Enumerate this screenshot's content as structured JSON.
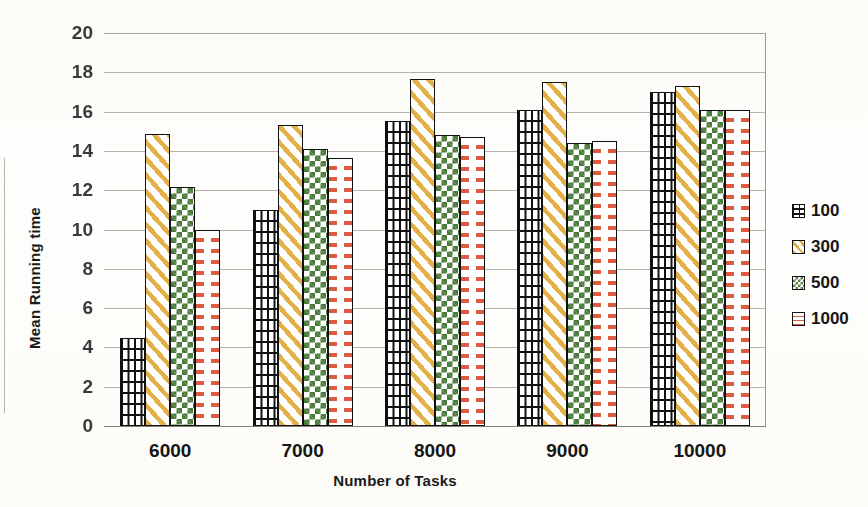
{
  "chart_data": {
    "type": "bar",
    "title": "",
    "xlabel": "Number of Tasks",
    "ylabel": "Mean Running time",
    "categories": [
      "6000",
      "7000",
      "8000",
      "9000",
      "10000"
    ],
    "series": [
      {
        "name": "100",
        "values": [
          4.5,
          11.0,
          15.5,
          16.1,
          17.0
        ],
        "pattern": "brick",
        "color": "#111111"
      },
      {
        "name": "300",
        "values": [
          14.85,
          15.3,
          17.65,
          17.5,
          17.3
        ],
        "pattern": "diagonal-stripes",
        "color": "#e3af47"
      },
      {
        "name": "500",
        "values": [
          12.15,
          14.1,
          14.8,
          14.4,
          16.1
        ],
        "pattern": "checkerboard",
        "color": "#4b7b3b"
      },
      {
        "name": "1000",
        "values": [
          10.0,
          13.65,
          14.7,
          14.5,
          16.1
        ],
        "pattern": "horizontal-dashes",
        "color": "#dd5b41"
      }
    ],
    "ylim": [
      0,
      20
    ],
    "ytick_step": 2,
    "yticks": [
      "20",
      "18",
      "16",
      "14",
      "12",
      "10",
      "8",
      "6",
      "4",
      "2",
      "0"
    ],
    "grid": true,
    "legend_position": "right"
  },
  "legend": {
    "items": [
      {
        "label": "100"
      },
      {
        "label": "300"
      },
      {
        "label": "500"
      },
      {
        "label": "1000"
      }
    ]
  },
  "axes": {
    "y_title": "Mean Running time",
    "x_title": "Number of Tasks"
  }
}
